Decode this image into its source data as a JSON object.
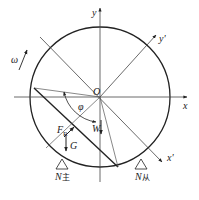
{
  "diagram": {
    "type": "free-body force diagram of rotating drum",
    "labels": {
      "y_axis": "y",
      "x_axis": "x",
      "y_prime_axis": "y'",
      "x_prime_axis": "x'",
      "origin": "O",
      "angular_velocity": "ω",
      "angle": "φ",
      "resultant_force": "F",
      "resultant_force_sub": "R",
      "gravity": "G",
      "weight": "W",
      "drive_support": "N",
      "drive_support_sub": "主",
      "driven_support": "N",
      "driven_support_sub": "从"
    },
    "colors": {
      "stroke": "#222222",
      "thin_stroke": "#555555",
      "background": "#ffffff"
    }
  },
  "caption": {
    "text": ""
  }
}
